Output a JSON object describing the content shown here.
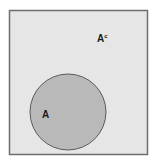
{
  "diagram": {
    "type": "venn",
    "universe": {
      "label": "A",
      "superscript": "c",
      "fill": "#e6e6e6",
      "stroke": "#6e6e6e"
    },
    "set": {
      "label": "A",
      "fill": "#b9b9b9",
      "stroke": "#5a5a5a"
    }
  }
}
